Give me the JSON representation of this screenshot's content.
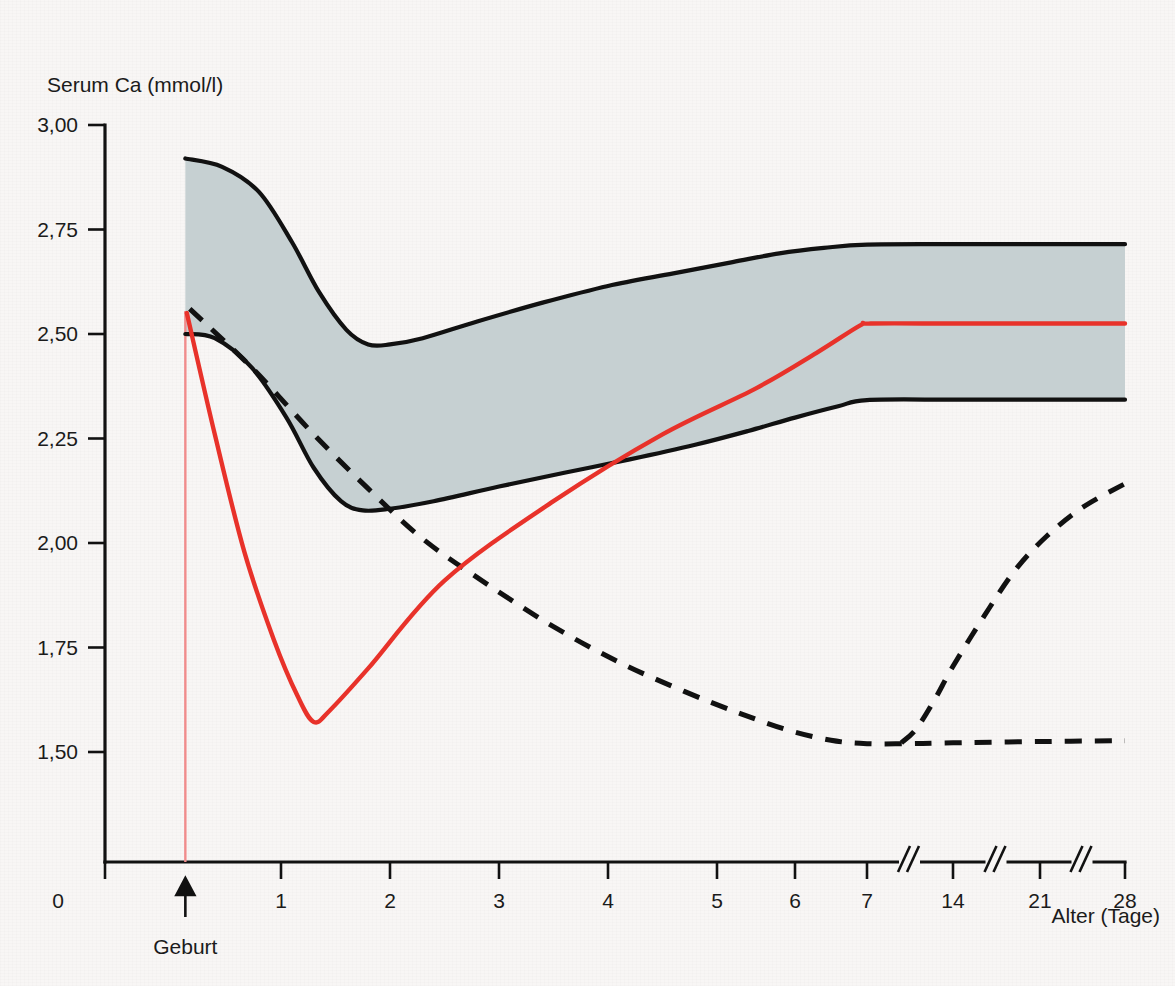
{
  "chart_data": {
    "type": "line",
    "title": "",
    "ylabel": "Serum Ca (mmol/l)",
    "xlabel": "Alter (Tage)",
    "ylim": [
      1.25,
      3.0
    ],
    "xlim": [
      0,
      28
    ],
    "grid": false,
    "legend_position": "none",
    "y_ticks": [
      "3,00",
      "2,75",
      "2,50",
      "2,25",
      "2,00",
      "1,75",
      "1,50"
    ],
    "y_tick_values": [
      3.0,
      2.75,
      2.5,
      2.25,
      2.0,
      1.75,
      1.5
    ],
    "x_ticks": [
      "0",
      "1",
      "2",
      "3",
      "4",
      "5",
      "6",
      "7",
      "14",
      "21",
      "28"
    ],
    "x_tick_values": [
      0,
      1,
      2,
      3,
      4,
      5,
      6,
      7,
      14,
      21,
      28
    ],
    "axis_breaks_after": [
      7,
      14,
      21
    ],
    "annotations": [
      {
        "name": "birth-marker",
        "label": "Geburt",
        "x": 0.35,
        "type": "vertical-line-with-arrow",
        "color": "#f08c8c"
      }
    ],
    "series": [
      {
        "name": "Normbereich (Referenzband) – obere Grenze",
        "style": "solid-black-band-edge",
        "color": "#111111",
        "points": [
          [
            0.35,
            2.92
          ],
          [
            0.6,
            2.9
          ],
          [
            0.85,
            2.84
          ],
          [
            1.1,
            2.72
          ],
          [
            1.35,
            2.6
          ],
          [
            1.6,
            2.51
          ],
          [
            1.8,
            2.475
          ],
          [
            2.0,
            2.475
          ],
          [
            2.3,
            2.49
          ],
          [
            2.8,
            2.53
          ],
          [
            3.4,
            2.575
          ],
          [
            4.0,
            2.615
          ],
          [
            4.6,
            2.645
          ],
          [
            5.2,
            2.672
          ],
          [
            5.8,
            2.693
          ],
          [
            6.4,
            2.706
          ],
          [
            7.0,
            2.714
          ],
          [
            14.0,
            2.715
          ],
          [
            21.0,
            2.715
          ],
          [
            28.0,
            2.715
          ]
        ]
      },
      {
        "name": "Normbereich (Referenzband) – untere Grenze",
        "style": "solid-black-band-edge",
        "color": "#111111",
        "points": [
          [
            0.35,
            2.5
          ],
          [
            0.55,
            2.49
          ],
          [
            0.8,
            2.42
          ],
          [
            1.05,
            2.3
          ],
          [
            1.3,
            2.18
          ],
          [
            1.55,
            2.1
          ],
          [
            1.75,
            2.078
          ],
          [
            2.0,
            2.082
          ],
          [
            2.4,
            2.1
          ],
          [
            3.0,
            2.135
          ],
          [
            3.6,
            2.168
          ],
          [
            4.2,
            2.2
          ],
          [
            4.8,
            2.235
          ],
          [
            5.4,
            2.268
          ],
          [
            6.0,
            2.3
          ],
          [
            6.6,
            2.327
          ],
          [
            7.0,
            2.342
          ],
          [
            14.0,
            2.343
          ],
          [
            21.0,
            2.343
          ],
          [
            28.0,
            2.343
          ]
        ]
      },
      {
        "name": "Serum-Ca Verlauf (rot)",
        "style": "solid-red",
        "color": "#e8322a",
        "points": [
          [
            0.36,
            2.55
          ],
          [
            0.55,
            2.26
          ],
          [
            0.75,
            1.98
          ],
          [
            0.95,
            1.77
          ],
          [
            1.15,
            1.635
          ],
          [
            1.3,
            1.572
          ],
          [
            1.45,
            1.6
          ],
          [
            1.8,
            1.7
          ],
          [
            2.5,
            1.91
          ],
          [
            3.5,
            2.1
          ],
          [
            4.5,
            2.26
          ],
          [
            5.5,
            2.37
          ],
          [
            6.3,
            2.455
          ],
          [
            6.9,
            2.52
          ],
          [
            7.3,
            2.525
          ],
          [
            14.0,
            2.525
          ],
          [
            21.0,
            2.525
          ],
          [
            28.0,
            2.525
          ]
        ]
      },
      {
        "name": "Gestrichelte Kurve – absteigend zum Plateau",
        "style": "dashed-black",
        "color": "#111111",
        "points": [
          [
            0.38,
            2.56
          ],
          [
            0.8,
            2.42
          ],
          [
            1.3,
            2.26
          ],
          [
            1.8,
            2.13
          ],
          [
            2.3,
            2.01
          ],
          [
            2.9,
            1.9
          ],
          [
            3.5,
            1.8
          ],
          [
            4.1,
            1.715
          ],
          [
            4.7,
            1.645
          ],
          [
            5.3,
            1.592
          ],
          [
            5.9,
            1.553
          ],
          [
            6.5,
            1.528
          ],
          [
            7.0,
            1.52
          ],
          [
            10.5,
            1.52
          ],
          [
            14.0,
            1.522
          ],
          [
            21.0,
            1.525
          ],
          [
            28.0,
            1.527
          ]
        ]
      },
      {
        "name": "Gestrichelte Kurve – ansteigender Ast",
        "style": "dashed-black",
        "color": "#111111",
        "points": [
          [
            9.8,
            1.522
          ],
          [
            11.0,
            1.555
          ],
          [
            12.5,
            1.625
          ],
          [
            14.0,
            1.705
          ],
          [
            16.5,
            1.825
          ],
          [
            19.0,
            1.935
          ],
          [
            21.5,
            2.015
          ],
          [
            24.5,
            2.085
          ],
          [
            28.0,
            2.142
          ]
        ]
      }
    ],
    "band": {
      "name": "Referenzbereich",
      "fill_color": "#c3ced0",
      "upper_series": "Normbereich (Referenzband) – obere Grenze",
      "lower_series": "Normbereich (Referenzband) – untere Grenze"
    }
  },
  "axes": {
    "y_axis_title": "Serum Ca (mmol/l)",
    "x_axis_title": "Alter (Tage)",
    "y_labels": [
      "3,00",
      "2,75",
      "2,50",
      "2,25",
      "2,00",
      "1,75",
      "1,50"
    ],
    "x_labels": [
      "0",
      "1",
      "2",
      "3",
      "4",
      "5",
      "6",
      "7",
      "14",
      "21",
      "28"
    ],
    "birth_label": "Geburt"
  },
  "colors": {
    "background": "#f8f6f5",
    "axis": "#111111",
    "band_fill": "#c3ced0",
    "red_curve": "#e8322a",
    "birth_line": "#f4a0a0"
  }
}
